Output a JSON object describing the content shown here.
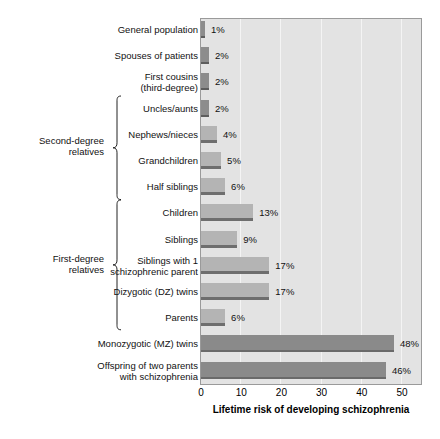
{
  "chart_data": {
    "type": "bar",
    "orientation": "horizontal",
    "title": "",
    "xlabel": "Lifetime risk of developing schizophrenia",
    "ylabel": "",
    "xlim": [
      0,
      55
    ],
    "xticks": [
      0,
      10,
      20,
      30,
      40,
      50
    ],
    "xtick_labels": [
      "0",
      "10",
      "20",
      "30",
      "40",
      "50"
    ],
    "grid": true,
    "legend": "none",
    "value_suffix": "%",
    "categories": [
      "General population",
      "Spouses of patients",
      "First cousins (third-degree)",
      "Uncles/aunts",
      "Nephews/nieces",
      "Grandchildren",
      "Half siblings",
      "Children",
      "Siblings",
      "Siblings with 1 schizophrenic parent",
      "Dizygotic (DZ) twins",
      "Parents",
      "Monozygotic (MZ) twins",
      "Offspring of two parents with schizophrenia"
    ],
    "values": [
      1,
      2,
      2,
      2,
      4,
      5,
      6,
      13,
      9,
      17,
      17,
      6,
      48,
      46
    ],
    "value_labels": [
      "1%",
      "2%",
      "2%",
      "2%",
      "4%",
      "5%",
      "6%",
      "13%",
      "9%",
      "17%",
      "17%",
      "6%",
      "48%",
      "46%"
    ],
    "bars": [
      {
        "label_lines": [
          "General population"
        ],
        "value": 1,
        "value_label": "1%",
        "style": "small"
      },
      {
        "label_lines": [
          "Spouses of patients"
        ],
        "value": 2,
        "value_label": "2%",
        "style": "small"
      },
      {
        "label_lines": [
          "First cousins",
          "(third-degree)"
        ],
        "value": 2,
        "value_label": "2%",
        "style": "small"
      },
      {
        "label_lines": [
          "Uncles/aunts"
        ],
        "value": 2,
        "value_label": "2%",
        "style": "small"
      },
      {
        "label_lines": [
          "Nephews/nieces"
        ],
        "value": 4,
        "value_label": "4%",
        "style": "mid"
      },
      {
        "label_lines": [
          "Grandchildren"
        ],
        "value": 5,
        "value_label": "5%",
        "style": "mid"
      },
      {
        "label_lines": [
          "Half siblings"
        ],
        "value": 6,
        "value_label": "6%",
        "style": "mid"
      },
      {
        "label_lines": [
          "Children"
        ],
        "value": 13,
        "value_label": "13%",
        "style": "mid"
      },
      {
        "label_lines": [
          "Siblings"
        ],
        "value": 9,
        "value_label": "9%",
        "style": "mid"
      },
      {
        "label_lines": [
          "Siblings with 1",
          "schizophrenic parent"
        ],
        "value": 17,
        "value_label": "17%",
        "style": "mid"
      },
      {
        "label_lines": [
          "Dizygotic (DZ) twins"
        ],
        "value": 17,
        "value_label": "17%",
        "style": "mid"
      },
      {
        "label_lines": [
          "Parents"
        ],
        "value": 6,
        "value_label": "6%",
        "style": "mid"
      },
      {
        "label_lines": [
          "Monozygotic (MZ) twins"
        ],
        "value": 48,
        "value_label": "48%",
        "style": "large"
      },
      {
        "label_lines": [
          "Offspring of two parents",
          "with schizophrenia"
        ],
        "value": 46,
        "value_label": "46%",
        "style": "large"
      }
    ],
    "groups": [
      {
        "id": "second-degree",
        "label_lines": [
          "Second-degree",
          "relatives"
        ],
        "first_index": 3,
        "last_index": 6
      },
      {
        "id": "first-degree",
        "label_lines": [
          "First-degree",
          "relatives"
        ],
        "first_index": 7,
        "last_index": 11
      }
    ],
    "colors": {
      "plot_background": "#e3e3e3",
      "gridline": "#f4f4f4",
      "bar_small": "#8c8c8c",
      "bar_mid": "#b4b4b4",
      "bar_large": "#8a8a8a",
      "bar_edge": "#6a6a6a",
      "text": "#111111",
      "axis": "#000000"
    }
  }
}
